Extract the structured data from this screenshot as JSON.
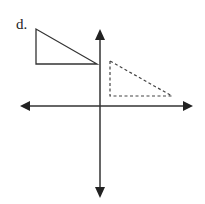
{
  "label": "d.",
  "diagram": {
    "type": "coordinate-plane-transformation",
    "axes": {
      "x_axis": "horizontal line with arrows both ends",
      "y_axis": "vertical line with arrows both ends"
    },
    "shapes": [
      {
        "name": "original-triangle",
        "style": "solid",
        "quadrant": "II"
      },
      {
        "name": "image-triangle",
        "style": "dashed",
        "quadrant": "I"
      }
    ],
    "colors": {
      "stroke": "#333333",
      "background": "#ffffff"
    }
  }
}
